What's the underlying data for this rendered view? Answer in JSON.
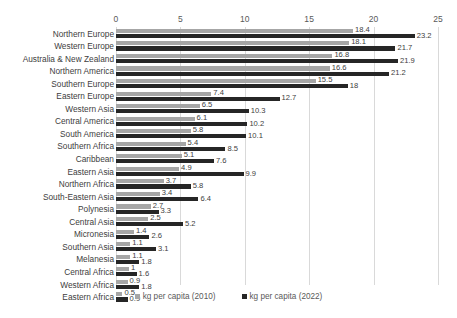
{
  "chart_data": {
    "type": "bar",
    "orientation": "horizontal",
    "title": "",
    "subtitle": "",
    "xlabel": "",
    "ylabel": "",
    "xlim": [
      0,
      25
    ],
    "xticks": [
      0,
      5,
      10,
      15,
      20,
      25
    ],
    "grid": true,
    "legend_position": "bottom",
    "categories": [
      "Northern Europe",
      "Western Europe",
      "Australia & New Zealand",
      "Northern America",
      "Southern Europe",
      "Eastern Europe",
      "Western Asia",
      "Central America",
      "South America",
      "Southern Africa",
      "Caribbean",
      "Eastern Asia",
      "Northern Africa",
      "South-Eastern Asia",
      "Polynesia",
      "Central Asia",
      "Micronesia",
      "Southern Asia",
      "Melanesia",
      "Central Africa",
      "Western Africa",
      "Eastern Africa"
    ],
    "series": [
      {
        "name": "kg per capita (2010)",
        "color": "#a6a6a6",
        "values": [
          18.4,
          18.1,
          16.8,
          16.6,
          15.5,
          7.4,
          6.5,
          6.1,
          5.8,
          5.4,
          5.1,
          4.9,
          3.7,
          3.4,
          2.7,
          2.5,
          1.4,
          1.1,
          1.1,
          1,
          0.9,
          0.5
        ],
        "labels": [
          "18.4",
          "18.1",
          "16.8",
          "16.6",
          "15.5",
          "7.4",
          "6.5",
          "6.1",
          "5.8",
          "5.4",
          "5.1",
          "4.9",
          "3.7",
          "3.4",
          "2.7",
          "2.5",
          "1.4",
          "1.1",
          "1.1",
          "1",
          "0.9",
          "0.5"
        ]
      },
      {
        "name": "kg per capita (2022)",
        "color": "#262626",
        "values": [
          23.2,
          21.7,
          21.9,
          21.2,
          18,
          12.7,
          10.3,
          10.2,
          10.1,
          8.5,
          7.6,
          9.9,
          5.8,
          6.4,
          3.3,
          5.2,
          2.6,
          3.1,
          1.8,
          1.6,
          1.8,
          0.9
        ],
        "labels": [
          "23.2",
          "21.7",
          "21.9",
          "21.2",
          "18",
          "12.7",
          "10.3",
          "10.2",
          "10.1",
          "8.5",
          "7.6",
          "9.9",
          "5.8",
          "6.4",
          "3.3",
          "5.2",
          "2.6",
          "3.1",
          "1.8",
          "1.6",
          "1.8",
          "0.9"
        ]
      }
    ]
  },
  "legend": {
    "items": [
      {
        "label": "kg per capita (2010)",
        "color": "#a6a6a6"
      },
      {
        "label": "kg per capita (2022)",
        "color": "#262626"
      }
    ]
  }
}
